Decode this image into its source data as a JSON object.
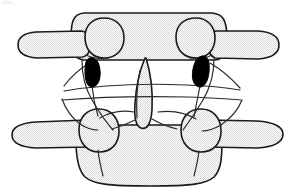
{
  "figure": {
    "caption_fragment": "cont.",
    "canvas": {
      "width": 297,
      "height": 195
    },
    "colors": {
      "background": "#ffffff",
      "bone_fill": "#ececec",
      "outline": "#1a1a1a",
      "inner_line": "#2b2b2b",
      "pedicle_fill": "#000000",
      "caption_text": "#d9d9d9"
    },
    "stroke_widths": {
      "outline": 1.6,
      "inner_line": 1.2,
      "thin_line": 1.0
    }
  },
  "structures": [
    {
      "id": "upper-vertebral-body",
      "label": "Upper vertebral body",
      "type": "filled-outline",
      "path": "M 71 38 C 71 20 74 14 84 13 L 212 13 C 223 14 227 20 227 39 C 227 52 224 59 215 60 L 84 60 C 74 59 71 52 71 38 Z"
    },
    {
      "id": "upper-left-transverse-process",
      "label": "Upper left transverse process",
      "type": "filled-outline",
      "path": "M 82 31 L 36 32 C 23 33 18 38 18 45 C 18 52 24 57 37 58 L 83 57 C 88 56 90 50 90 44 C 90 37 88 32 82 31 Z"
    },
    {
      "id": "upper-right-transverse-process",
      "label": "Upper right transverse process",
      "type": "filled-outline",
      "path": "M 216 31 L 258 31 C 272 32 279 37 279 45 C 279 53 272 58 258 59 L 215 58 C 210 56 208 51 208 44 C 208 37 211 32 216 31 Z"
    },
    {
      "id": "upper-left-superior-articular-facet",
      "label": "Upper left superior articular process",
      "type": "filled-outline",
      "path": "M 85 37 C 85 25 93 18 104 18 C 116 18 124 26 124 38 C 124 50 116 58 104 58 C 93 58 85 50 85 37 Z"
    },
    {
      "id": "upper-right-superior-articular-facet",
      "label": "Upper right superior articular process",
      "type": "filled-outline",
      "path": "M 176 37 C 176 25 184 18 196 18 C 207 18 215 26 215 38 C 215 50 207 58 196 58 C 184 58 176 50 176 37 Z"
    },
    {
      "id": "lower-vertebral-body",
      "label": "Lower vertebral body",
      "type": "filled-outline",
      "path": "M 76 140 C 76 130 79 126 88 125 L 209 125 C 219 126 222 131 222 141 C 222 158 221 170 214 177 C 206 184 192 186 150 186 C 108 186 93 184 85 177 C 78 170 76 157 76 140 Z"
    },
    {
      "id": "lower-left-transverse-process",
      "label": "Lower left transverse process",
      "type": "filled-outline",
      "path": "M 87 120 L 36 122 C 20 123 12 128 12 135 C 12 142 20 147 36 148 L 89 147 C 95 145 97 139 97 133 C 97 126 93 121 87 120 Z"
    },
    {
      "id": "lower-right-transverse-process",
      "label": "Lower right transverse process",
      "type": "filled-outline",
      "path": "M 209 120 L 257 121 C 274 122 283 127 283 134 C 283 142 274 147 257 148 L 208 147 C 202 145 200 139 200 133 C 200 126 203 121 209 120 Z"
    },
    {
      "id": "lower-left-inferior-articular-facet",
      "label": "Lower left inferior articular process",
      "type": "filled-outline",
      "path": "M 79 130 C 79 117 87 109 99 109 C 111 109 119 118 119 131 C 119 144 111 152 99 152 C 87 152 79 143 79 130 Z"
    },
    {
      "id": "lower-right-inferior-articular-facet",
      "label": "Lower right inferior articular process",
      "type": "filled-outline",
      "path": "M 181 130 C 181 117 189 109 201 109 C 213 109 221 118 221 131 C 221 144 213 152 201 152 C 189 152 181 143 181 130 Z"
    },
    {
      "id": "spinous-process",
      "label": "Spinous process (midline)",
      "type": "filled-outline",
      "path": "M 145 58 C 139 72 136 86 135 104 C 134 118 136 126 141 128 C 147 130 151 124 152 110 C 153 92 151 74 146 58 Z"
    },
    {
      "id": "left-pedicle-shadow",
      "label": "Left pedicle (dark oval)",
      "type": "solid-black",
      "path": "M 90 58 C 95 57 99 61 100 70 C 101 79 98 86 93 87 C 88 88 85 82 85 72 C 85 63 86 59 90 58 Z"
    },
    {
      "id": "right-pedicle-shadow",
      "label": "Right pedicle (dark oval)",
      "type": "solid-black",
      "path": "M 203 56 C 208 56 210 62 209 72 C 208 82 204 88 199 87 C 194 86 191 79 193 69 C 195 60 198 56 203 56 Z"
    }
  ],
  "inner_lines": [
    {
      "id": "upper-endplate-line",
      "label": "Upper endplate contour",
      "path": "M 64 91 C 100 85 140 83 186 85 C 212 86 228 88 240 90"
    },
    {
      "id": "lower-endplate-line",
      "label": "Lower endplate contour",
      "path": "M 62 100 C 98 97 140 96 188 97 C 214 98 230 99 241 100"
    },
    {
      "id": "left-lamina-line",
      "label": "Left lamina contour",
      "path": "M 64 86 C 70 78 78 70 88 64"
    },
    {
      "id": "left-lamina-lower",
      "label": "Left lamina lower contour",
      "path": "M 62 99 C 66 110 72 118 80 124"
    },
    {
      "id": "right-lamina-line",
      "label": "Right lamina contour",
      "path": "M 240 88 C 232 79 222 70 210 63"
    },
    {
      "id": "right-lamina-lower",
      "label": "Right lamina lower contour",
      "path": "M 242 100 C 238 110 230 119 221 125"
    },
    {
      "id": "left-pedicle-stem",
      "label": "Left pedicle stem",
      "path": "M 92 86 C 93 96 95 106 98 116"
    },
    {
      "id": "right-pedicle-stem",
      "label": "Right pedicle stem",
      "path": "M 200 86 C 198 96 196 106 194 117"
    },
    {
      "id": "left-facet-joint-line",
      "label": "Left facet joint line",
      "path": "M 82 60 C 82 74 85 88 92 100 C 99 112 106 122 113 130"
    },
    {
      "id": "right-facet-joint-line",
      "label": "Right facet joint line",
      "path": "M 214 59 C 214 73 210 88 203 100 C 196 112 189 122 183 130"
    },
    {
      "id": "left-spinal-arch",
      "label": "Left neural arch curve",
      "path": "M 100 118 C 110 112 122 110 134 112"
    },
    {
      "id": "right-spinal-arch",
      "label": "Right neural arch curve",
      "path": "M 196 119 C 186 113 172 110 158 112"
    },
    {
      "id": "left-inferior-notch",
      "label": "Left inferior notch",
      "path": "M 98 150 C 99 160 101 168 103 176"
    },
    {
      "id": "right-inferior-notch",
      "label": "Right inferior notch",
      "path": "M 199 151 C 198 160 196 168 194 176"
    },
    {
      "id": "left-body-shoulder",
      "label": "Left lower body shoulder",
      "path": "M 80 124 C 86 128 92 130 98 130"
    },
    {
      "id": "right-body-shoulder",
      "label": "Right lower body shoulder",
      "path": "M 221 125 C 214 129 208 131 202 131"
    },
    {
      "id": "spinous-left-edge",
      "label": "Spinous process left edge",
      "path": "M 140 70 C 137 86 136 102 137 118"
    },
    {
      "id": "spinous-base-left",
      "label": "Spinous process base left",
      "path": "M 135 120 C 127 124 119 127 112 129"
    },
    {
      "id": "spinous-base-right",
      "label": "Spinous process base right",
      "path": "M 152 119 C 160 124 169 127 177 129"
    },
    {
      "id": "upper-left-facet-crease",
      "label": "Upper left facet crease",
      "path": "M 86 55 C 92 58 100 59 108 58"
    },
    {
      "id": "upper-right-facet-crease",
      "label": "Upper right facet crease",
      "path": "M 212 55 C 206 58 198 59 190 58"
    }
  ]
}
